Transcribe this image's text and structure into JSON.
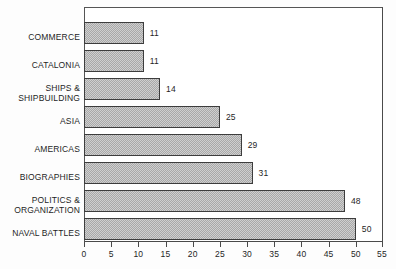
{
  "chart_data": {
    "type": "bar",
    "orientation": "horizontal",
    "title": "",
    "subtitle": "",
    "xlabel": "",
    "ylabel": "",
    "xlim": [
      0,
      55
    ],
    "xtick_step": 5,
    "xticks": [
      0,
      5,
      10,
      15,
      20,
      25,
      30,
      35,
      40,
      45,
      50,
      55
    ],
    "grid": false,
    "legend": false,
    "legend_position": "none",
    "bar_fill_color": "#cfcfcf",
    "bar_pattern": "dither-stipple",
    "bar_border_color": "#3d3d3d",
    "frame_color": "#4a4a4a",
    "value_labels_shown": true,
    "categories": [
      "COMMERCE",
      "CATALONIA",
      "SHIPS &\nSHIPBUILDING",
      "ASIA",
      "AMERICAS",
      "BIOGRAPHIES",
      "POLITICS &\nORGANIZATION",
      "NAVAL BATTLES"
    ],
    "values": [
      11,
      11,
      14,
      25,
      29,
      31,
      48,
      50
    ],
    "bars": [
      {
        "category": "COMMERCE",
        "value": 11,
        "value_label": "11"
      },
      {
        "category": "CATALONIA",
        "value": 11,
        "value_label": "11"
      },
      {
        "category": "SHIPS &\nSHIPBUILDING",
        "value": 14,
        "value_label": "14"
      },
      {
        "category": "ASIA",
        "value": 25,
        "value_label": "25"
      },
      {
        "category": "AMERICAS",
        "value": 29,
        "value_label": "29"
      },
      {
        "category": "BIOGRAPHIES",
        "value": 31,
        "value_label": "31"
      },
      {
        "category": "POLITICS &\nORGANIZATION",
        "value": 48,
        "value_label": "48"
      },
      {
        "category": "NAVAL BATTLES",
        "value": 50,
        "value_label": "50"
      }
    ]
  }
}
